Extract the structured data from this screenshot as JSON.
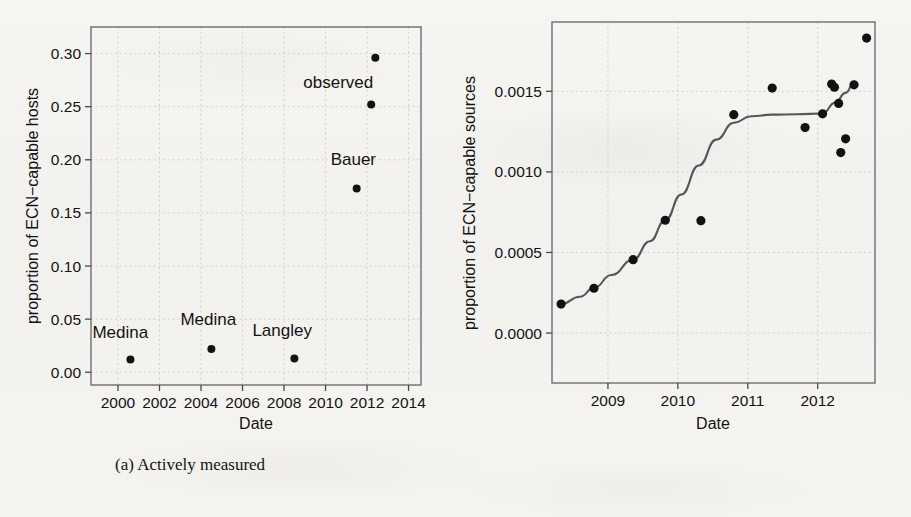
{
  "figure": {
    "panels": [
      {
        "caption": "(a) Actively measured",
        "xlabel": "Date",
        "ylabel": "proportion of ECN−capable hosts"
      },
      {
        "caption": "(b) Passively measured",
        "xlabel": "Date",
        "ylabel": "proportion of ECN−capable sources"
      }
    ]
  },
  "chart_data": [
    {
      "type": "scatter",
      "title": "(a) Actively measured",
      "xlabel": "Date",
      "ylabel": "proportion of ECN−capable hosts",
      "xlim": [
        1998.7,
        2014.6
      ],
      "ylim": [
        -0.012,
        0.325
      ],
      "xticks": [
        2000,
        2002,
        2004,
        2006,
        2008,
        2010,
        2012,
        2014
      ],
      "xtick_labels": [
        "2000",
        "2002",
        "2004",
        "2006",
        "2008",
        "2010",
        "2012",
        "2014"
      ],
      "yticks": [
        0.0,
        0.05,
        0.1,
        0.15,
        0.2,
        0.25,
        0.3
      ],
      "ytick_labels": [
        "0.00",
        "0.05",
        "0.10",
        "0.15",
        "0.20",
        "0.25",
        "0.30"
      ],
      "grid": true,
      "legend": "none",
      "points": [
        {
          "x": 2000.6,
          "y": 0.012,
          "label": "Medina",
          "label_dx": -38,
          "label_dy": -22
        },
        {
          "x": 2004.5,
          "y": 0.022,
          "label": "Medina",
          "label_dx": -31,
          "label_dy": -24
        },
        {
          "x": 2008.5,
          "y": 0.013,
          "label": "Langley",
          "label_dx": -42,
          "label_dy": -22
        },
        {
          "x": 2011.5,
          "y": 0.173,
          "label": "Bauer",
          "label_dx": -26,
          "label_dy": -23
        },
        {
          "x": 2012.2,
          "y": 0.252,
          "label": "",
          "label_dx": 0,
          "label_dy": 0
        },
        {
          "x": 2012.4,
          "y": 0.296,
          "label": "observed",
          "label_dx": -72,
          "label_dy": 30
        }
      ],
      "annotations": [
        "Medina",
        "Medina",
        "Langley",
        "Bauer",
        "observed"
      ]
    },
    {
      "type": "scatter",
      "title": "(b) Passively measured",
      "xlabel": "Date",
      "ylabel": "proportion of ECN−capable sources",
      "xlim": [
        2008.2,
        2012.82
      ],
      "ylim": [
        -0.00031,
        0.00193
      ],
      "xticks": [
        2009,
        2010,
        2011,
        2012
      ],
      "xtick_labels": [
        "2009",
        "2010",
        "2011",
        "2012"
      ],
      "yticks": [
        0.0,
        0.0005,
        0.001,
        0.0015
      ],
      "ytick_labels": [
        "0.0000",
        "0.0005",
        "0.0010",
        "0.0015"
      ],
      "grid": true,
      "legend": "none",
      "points": [
        {
          "x": 2008.33,
          "y": 0.00018
        },
        {
          "x": 2008.8,
          "y": 0.000278
        },
        {
          "x": 2009.36,
          "y": 0.000455
        },
        {
          "x": 2009.82,
          "y": 0.0007
        },
        {
          "x": 2010.33,
          "y": 0.000697
        },
        {
          "x": 2010.8,
          "y": 0.001355
        },
        {
          "x": 2011.35,
          "y": 0.00152
        },
        {
          "x": 2011.82,
          "y": 0.001275
        },
        {
          "x": 2012.07,
          "y": 0.00136
        },
        {
          "x": 2012.2,
          "y": 0.001545
        },
        {
          "x": 2012.24,
          "y": 0.001525
        },
        {
          "x": 2012.3,
          "y": 0.001425
        },
        {
          "x": 2012.33,
          "y": 0.00112
        },
        {
          "x": 2012.4,
          "y": 0.001205
        },
        {
          "x": 2012.52,
          "y": 0.00154
        },
        {
          "x": 2012.7,
          "y": 0.00183
        }
      ],
      "series": [
        {
          "name": "smoothed trend",
          "type": "line",
          "x": [
            2008.33,
            2008.6,
            2008.8,
            2009.05,
            2009.36,
            2009.6,
            2009.82,
            2010.05,
            2010.3,
            2010.55,
            2010.8,
            2011.05,
            2011.35,
            2011.7,
            2012.07,
            2012.25,
            2012.4,
            2012.52
          ],
          "y": [
            0.00018,
            0.000225,
            0.00028,
            0.00036,
            0.000455,
            0.00057,
            0.0007,
            0.00086,
            0.00104,
            0.0012,
            0.001305,
            0.001345,
            0.001355,
            0.001358,
            0.001362,
            0.00143,
            0.00149,
            0.001555
          ]
        }
      ]
    }
  ]
}
